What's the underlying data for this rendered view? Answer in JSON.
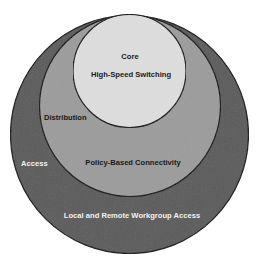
{
  "diagram": {
    "type": "nested-circles",
    "layers": [
      {
        "id": "access",
        "name": "Access",
        "description": "Local and Remote Workgroup Access",
        "fill": "#5b5b5b",
        "text_color": "#f2f2f2"
      },
      {
        "id": "distribution",
        "name": "Distribution",
        "description": "Policy-Based Connectivity",
        "fill": "#9c9c9c",
        "text_color": "#1a1a1a"
      },
      {
        "id": "core",
        "name": "Core",
        "description": "High-Speed Switching",
        "fill": "#dedede",
        "text_color": "#1a1a1a"
      }
    ],
    "outline_color": "#111111",
    "background": "#ffffff"
  }
}
